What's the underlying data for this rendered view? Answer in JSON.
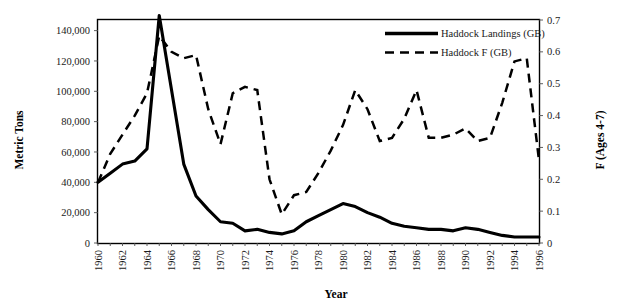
{
  "chart_data": {
    "type": "line",
    "title": "",
    "xlabel": "Year",
    "ylabel": "Metric Tons",
    "y2label": "F (Ages 4-7)",
    "grid": false,
    "legend_position": "top-right",
    "xlim": [
      1960,
      1996
    ],
    "ylim": [
      0,
      147000
    ],
    "y2lim": [
      0,
      0.7
    ],
    "x": [
      1960,
      1961,
      1962,
      1963,
      1964,
      1965,
      1966,
      1967,
      1968,
      1969,
      1970,
      1971,
      1972,
      1973,
      1974,
      1975,
      1976,
      1977,
      1978,
      1979,
      1980,
      1981,
      1982,
      1983,
      1984,
      1985,
      1986,
      1987,
      1988,
      1989,
      1990,
      1991,
      1992,
      1993,
      1994,
      1995,
      1996
    ],
    "xtick_labels": [
      "1960",
      "1962",
      "1964",
      "1966",
      "1968",
      "1970",
      "1972",
      "1974",
      "1976",
      "1978",
      "1980",
      "1982",
      "1984",
      "1986",
      "1988",
      "1990",
      "1992",
      "1994",
      "1996"
    ],
    "ytick_labels": [
      "0",
      "20,000",
      "40,000",
      "60,000",
      "80,000",
      "100,000",
      "120,000",
      "140,000"
    ],
    "ytick_values": [
      0,
      20000,
      40000,
      60000,
      80000,
      100000,
      120000,
      140000
    ],
    "y2tick_labels": [
      "0",
      "0.1",
      "0.2",
      "0.3",
      "0.4",
      "0.5",
      "0.6",
      "0.7"
    ],
    "y2tick_values": [
      0,
      0.1,
      0.2,
      0.3,
      0.4,
      0.5,
      0.6,
      0.7
    ],
    "series": [
      {
        "name": "Haddock Landings (GB)",
        "axis": "left",
        "style": "solid",
        "color": "#000000",
        "values": [
          40000,
          46000,
          52000,
          54000,
          62000,
          150000,
          101000,
          52000,
          31000,
          22000,
          14000,
          13000,
          8000,
          9000,
          7000,
          6000,
          8000,
          14000,
          18000,
          22000,
          26000,
          24000,
          20000,
          17000,
          13000,
          11000,
          10000,
          9000,
          9000,
          8000,
          10000,
          9000,
          7000,
          5000,
          4000,
          4000,
          4000
        ]
      },
      {
        "name": "Haddock F (GB)",
        "axis": "right",
        "style": "dashed",
        "color": "#000000",
        "values": [
          0.19,
          0.28,
          0.34,
          0.4,
          0.47,
          0.65,
          0.6,
          0.58,
          0.59,
          0.42,
          0.31,
          0.47,
          0.49,
          0.48,
          0.2,
          0.09,
          0.15,
          0.16,
          0.22,
          0.29,
          0.37,
          0.48,
          0.42,
          0.32,
          0.33,
          0.39,
          0.48,
          0.33,
          0.33,
          0.34,
          0.36,
          0.32,
          0.33,
          0.44,
          0.57,
          0.58,
          0.26
        ]
      }
    ]
  },
  "legend": {
    "items": [
      {
        "label": "Haddock Landings (GB)",
        "style": "solid"
      },
      {
        "label": "Haddock F (GB)",
        "style": "dashed"
      }
    ]
  },
  "axes": {
    "left_title": "Metric Tons",
    "right_title": "F (Ages 4-7)",
    "bottom_title": "Year"
  }
}
